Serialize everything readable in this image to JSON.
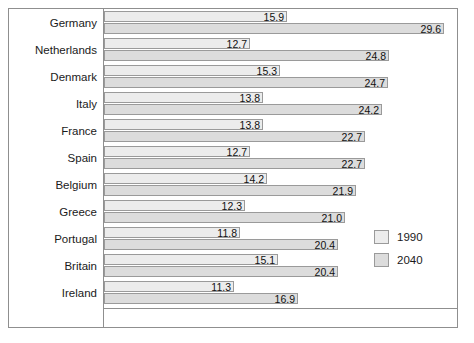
{
  "chart_data": {
    "type": "bar",
    "orientation": "horizontal",
    "title": "",
    "subtitle": "",
    "xlabel": "",
    "ylabel": "",
    "grid": false,
    "xlim": [
      0,
      30.8
    ],
    "legend_position": "bottom-right",
    "categories": [
      "Germany",
      "Netherlands",
      "Denmark",
      "Italy",
      "France",
      "Spain",
      "Belgium",
      "Greece",
      "Portugal",
      "Britain",
      "Ireland"
    ],
    "series": [
      {
        "name": "1990",
        "color": "#ececec",
        "values": [
          15.9,
          12.7,
          15.3,
          13.8,
          13.8,
          12.7,
          14.2,
          12.3,
          11.8,
          15.1,
          11.3
        ],
        "labels": [
          "15.9",
          "12.7",
          "15.3",
          "13.8",
          "13.8",
          "12.7",
          "14.2",
          "12.3",
          "11.8",
          "15.1",
          "11.3"
        ]
      },
      {
        "name": "2040",
        "color": "#dcdcdc",
        "values": [
          29.6,
          24.8,
          24.7,
          24.2,
          22.7,
          22.7,
          21.9,
          21.0,
          20.4,
          20.4,
          16.9
        ],
        "labels": [
          "29.6",
          "24.8",
          "24.7",
          "24.2",
          "22.7",
          "22.7",
          "21.9",
          "21.0",
          "20.4",
          "20.4",
          "16.9"
        ]
      }
    ]
  },
  "legend": {
    "entries": [
      {
        "label": "1990",
        "color": "#ececec"
      },
      {
        "label": "2040",
        "color": "#dcdcdc"
      }
    ]
  },
  "style": {
    "frame_border": "#8f8f8f",
    "bar_border": "#9a9a9a",
    "text_color": "#1a1a1a",
    "background": "#ffffff"
  }
}
